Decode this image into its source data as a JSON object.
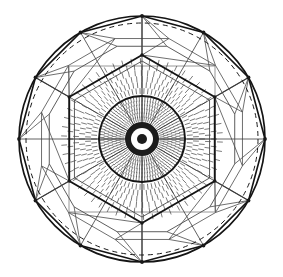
{
  "figure": {
    "canvas": {
      "width": 283,
      "height": 277,
      "background": "#ffffff"
    },
    "center": {
      "x": 142,
      "y": 139
    },
    "colors": {
      "ink": "#1a1a1a",
      "dark_line": "#141414",
      "mid_line": "#3a3a3a",
      "grid_line": "#8d8d8d",
      "light_line": "#707070",
      "hatch": "#2b2b2b",
      "background": "#ffffff"
    },
    "outer_circle": {
      "name": "outer-rim-circle",
      "radius": 123,
      "stroke": "#141414",
      "stroke_width": 1.7
    },
    "dashed_inner_rim": {
      "name": "dashed-rim-arc",
      "radius": 116,
      "stroke": "#1a1a1a",
      "stroke_width": 1.0,
      "dash": "5 4"
    },
    "dodecagon": {
      "name": "outer-dodecagon",
      "sides": 12,
      "radius": 123,
      "rotation_deg": -90,
      "stroke": "#141414",
      "stroke_width": 1.6
    },
    "mid_dodecagon": {
      "name": "mid-dodecagon",
      "sides": 12,
      "radius": 96,
      "rotation_deg": -75,
      "stroke": "#4a4a4a",
      "stroke_width": 0.9
    },
    "hexagon": {
      "name": "inner-hexagon",
      "sides": 6,
      "radius": 84,
      "rotation_deg": -90,
      "stroke": "#141414",
      "stroke_width": 1.9
    },
    "hexagon_inner": {
      "name": "inner-hexagon-secondary",
      "sides": 6,
      "radius": 78,
      "rotation_deg": -90,
      "stroke": "#4a4a4a",
      "stroke_width": 0.9
    },
    "square_grid": {
      "name": "orthogonal-grid",
      "half_size": 73,
      "stroke": "#8d8d8d",
      "stroke_width": 0.9,
      "offsets": [
        -73,
        0,
        73
      ]
    },
    "spokes": {
      "name": "radial-spokes",
      "count": 12,
      "inner_radius": 0,
      "outer_radius": 123,
      "stroke": "#3a3a3a",
      "stroke_width": 0.8
    },
    "core_circle": {
      "name": "core-boundary-circle",
      "radius": 43,
      "stroke": "#141414",
      "stroke_width": 2.0
    },
    "bullseye": {
      "name": "bullseye-center",
      "rings": [
        {
          "r": 17,
          "fill": "#1c1c1c"
        },
        {
          "r": 11,
          "fill": "#ffffff"
        },
        {
          "r": 5,
          "fill": "#1c1c1c"
        }
      ]
    },
    "hatch_field": {
      "name": "radial-hatch-field",
      "description": "short radial tick marks arranged on concentric rings",
      "stroke": "#2b2b2b",
      "stroke_width": 0.62,
      "rings": [
        {
          "radius": 20,
          "ticks": 60,
          "len": 4
        },
        {
          "radius": 24,
          "ticks": 66,
          "len": 4
        },
        {
          "radius": 28,
          "ticks": 72,
          "len": 4
        },
        {
          "radius": 32,
          "ticks": 78,
          "len": 4
        },
        {
          "radius": 36,
          "ticks": 84,
          "len": 4
        },
        {
          "radius": 40,
          "ticks": 90,
          "len": 4
        },
        {
          "radius": 48,
          "ticks": 78,
          "len": 5
        },
        {
          "radius": 54,
          "ticks": 78,
          "len": 5
        },
        {
          "radius": 60,
          "ticks": 72,
          "len": 5
        },
        {
          "radius": 66,
          "ticks": 66,
          "len": 5
        },
        {
          "radius": 72,
          "ticks": 60,
          "len": 5
        },
        {
          "radius": 78,
          "ticks": 54,
          "len": 5
        }
      ]
    },
    "facet_web": {
      "name": "facet-web",
      "description": "quadrilateral facets linking inner hexagon to outer dodecagon",
      "stroke": "#555555",
      "stroke_width": 0.85
    }
  },
  "chart_data": {
    "type": "scatter",
    "xlabel": "",
    "ylabel": "",
    "categories": [],
    "values": [],
    "annotations": [
      "outer circle radius 123 px",
      "dashed inner rim radius 116 px",
      "12-sided outer polygon",
      "6-sided inner hexagon radius 84 px",
      "core hatch boundary circle radius 43 px",
      "bullseye center at (142, 139)"
    ]
  }
}
